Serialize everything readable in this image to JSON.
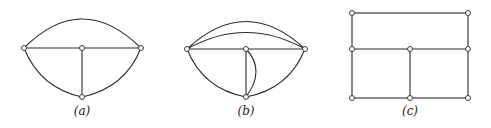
{
  "figures": [
    {
      "id": "a",
      "label": "(a)",
      "label_pos": [
        82,
        104
      ]
    },
    {
      "id": "b",
      "label": "(b)",
      "label_pos": [
        246,
        104
      ]
    },
    {
      "id": "c",
      "label": "(c)",
      "label_pos": [
        410,
        104
      ]
    }
  ],
  "colors": {
    "stroke": "#2a2a2a",
    "node_fill": "#ffffff",
    "background": "#ffffff"
  }
}
